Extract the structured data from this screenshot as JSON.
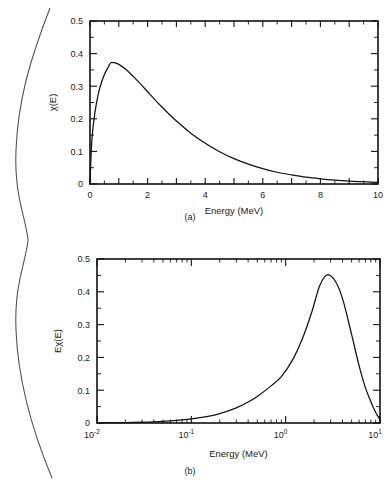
{
  "figure": {
    "brace_icon": "left-curly-brace",
    "panels": [
      {
        "id": "a",
        "caption": "(a)",
        "ylabel": "χ(E)",
        "xlabel": "Energy (MeV)"
      },
      {
        "id": "b",
        "caption": "(b)",
        "ylabel": "Eχ(E)",
        "xlabel": "Energy (MeV)"
      }
    ]
  },
  "chart_data": [
    {
      "type": "line",
      "id": "panel-a",
      "title": "",
      "caption": "(a)",
      "xlabel": "Energy (MeV)",
      "ylabel": "χ(E)",
      "xscale": "linear",
      "yscale": "linear",
      "xlim": [
        0,
        10
      ],
      "ylim": [
        0,
        0.5
      ],
      "grid": false,
      "legend": "none",
      "xticks": [
        0,
        2,
        4,
        6,
        8,
        10
      ],
      "xtick_labels": [
        "0",
        "2",
        "4",
        "6",
        "8",
        "10"
      ],
      "xminor_step": 0.5,
      "yticks": [
        0,
        0.1,
        0.2,
        0.3,
        0.4,
        0.5
      ],
      "ytick_labels": [
        "0",
        "0.1",
        "0.2",
        "0.3",
        "0.4",
        "0.5"
      ],
      "yminor_step": 0.05,
      "peak": {
        "x": 0.75,
        "y": 0.373
      },
      "x": [
        0.0,
        0.05,
        0.1,
        0.15,
        0.2,
        0.3,
        0.4,
        0.5,
        0.6,
        0.75,
        0.9,
        1.0,
        1.25,
        1.5,
        1.75,
        2.0,
        2.25,
        2.5,
        2.75,
        3.0,
        3.5,
        4.0,
        4.5,
        5.0,
        5.5,
        6.0,
        6.5,
        7.0,
        7.5,
        8.0,
        8.5,
        9.0,
        9.5,
        10.0
      ],
      "y": [
        0.0,
        0.113,
        0.169,
        0.206,
        0.235,
        0.281,
        0.312,
        0.336,
        0.353,
        0.373,
        0.371,
        0.367,
        0.351,
        0.33,
        0.307,
        0.283,
        0.259,
        0.236,
        0.214,
        0.193,
        0.156,
        0.125,
        0.099,
        0.078,
        0.061,
        0.047,
        0.036,
        0.028,
        0.021,
        0.016,
        0.012,
        0.009,
        0.007,
        0.005
      ]
    },
    {
      "type": "line",
      "id": "panel-b",
      "title": "",
      "caption": "(b)",
      "xlabel": "Energy (MeV)",
      "ylabel": "Eχ(E)",
      "xscale": "log",
      "yscale": "linear",
      "xlim": [
        0.01,
        10
      ],
      "ylim": [
        0,
        0.5
      ],
      "grid": false,
      "legend": "none",
      "xticks": [
        0.01,
        0.1,
        1,
        10
      ],
      "xtick_labels": [
        "10",
        "10",
        "10",
        "10"
      ],
      "xtick_exponents": [
        "-2",
        "-1",
        "0",
        "1"
      ],
      "yticks": [
        0,
        0.1,
        0.2,
        0.3,
        0.4,
        0.5
      ],
      "ytick_labels": [
        "0",
        "0.1",
        "0.2",
        "0.3",
        "0.4",
        "0.5"
      ],
      "yminor_step": 0.05,
      "peak": {
        "x": 1.9,
        "y": 0.452
      },
      "x": [
        0.01,
        0.02,
        0.03,
        0.05,
        0.07,
        0.1,
        0.15,
        0.2,
        0.3,
        0.4,
        0.5,
        0.7,
        0.9,
        1.2,
        1.5,
        1.9,
        2.3,
        2.8,
        3.4,
        4.0,
        5.0,
        6.0,
        7.0,
        8.0,
        9.0,
        10.0
      ],
      "y": [
        0.0005,
        0.0015,
        0.0027,
        0.0052,
        0.0079,
        0.0124,
        0.0204,
        0.0288,
        0.0463,
        0.0639,
        0.081,
        0.1132,
        0.1415,
        0.1955,
        0.256,
        0.34,
        0.419,
        0.452,
        0.43,
        0.38,
        0.27,
        0.175,
        0.108,
        0.065,
        0.032,
        0.01
      ]
    }
  ]
}
